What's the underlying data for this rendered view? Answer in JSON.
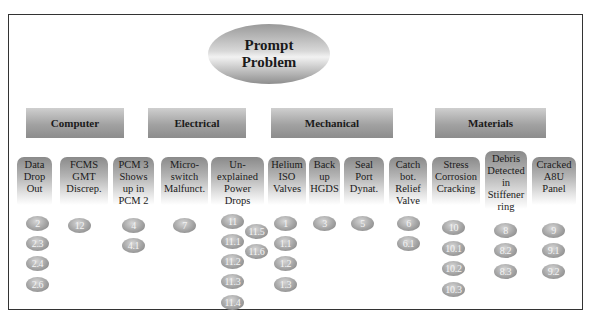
{
  "root": {
    "label_line1": "Prompt",
    "label_line2": "Problem"
  },
  "categories": [
    {
      "label": "Computer"
    },
    {
      "label": "Electrical"
    },
    {
      "label": "Mechanical"
    },
    {
      "label": "Materials"
    }
  ],
  "problems": [
    {
      "label": "Data\nDrop\nOut",
      "category": "Computer",
      "items": [
        "2",
        "2.3",
        "2.4",
        "2.6"
      ]
    },
    {
      "label": "FCMS\nGMT\nDiscrep.",
      "category": "Computer",
      "items": [
        "12"
      ]
    },
    {
      "label": "PCM 3\nShows\nup in\nPCM 2",
      "category": "Electrical",
      "items": [
        "4",
        "4.1"
      ]
    },
    {
      "label": "Micro-\nswitch\nMalfunct.",
      "category": "Electrical",
      "items": [
        "7"
      ]
    },
    {
      "label": "Un-\nexplained\nPower\nDrops",
      "category": "Electrical",
      "items": [
        "11",
        "11.1",
        "11.2",
        "11.3",
        "11.4",
        "11.5",
        "11.6"
      ]
    },
    {
      "label": "Helium\nISO\nValves",
      "category": "Mechanical",
      "items": [
        "1",
        "1.1",
        "1.2",
        "1.3"
      ]
    },
    {
      "label": "Back\nup\nHGDS",
      "category": "Mechanical",
      "items": [
        "3"
      ]
    },
    {
      "label": "Seal\nPort\nDynat.",
      "category": "Mechanical",
      "items": [
        "5"
      ]
    },
    {
      "label": "Catch\nbot.\nRelief\nValve",
      "category": "Mechanical",
      "items": [
        "6",
        "6.1"
      ]
    },
    {
      "label": "Stress\nCorrosion\nCracking",
      "category": "Materials",
      "items": [
        "10",
        "10.1",
        "10.2",
        "10.3"
      ]
    },
    {
      "label": "Debris\nDetected\nin\nStiffener\nring",
      "category": "Materials",
      "items": [
        "8",
        "8.2",
        "8.3"
      ]
    },
    {
      "label": "Cracked\nA8U\nPanel",
      "category": "Materials",
      "items": [
        "9",
        "9.1",
        "9.2"
      ]
    }
  ]
}
